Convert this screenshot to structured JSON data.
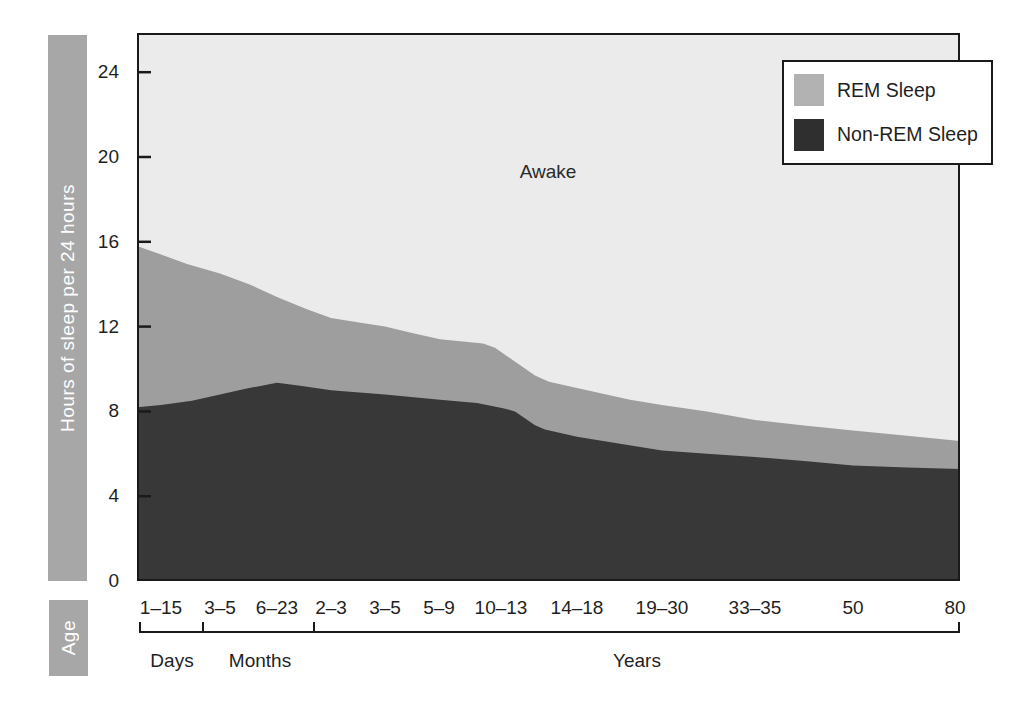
{
  "page": {
    "background": "#ffffff"
  },
  "y_axis_bar": {
    "label": "Hours of sleep per 24 hours"
  },
  "age_bar": {
    "label": "Age"
  },
  "annotations": {
    "awake": "Awake"
  },
  "legend": {
    "items": [
      {
        "label": "REM Sleep",
        "color": "#b2b2b2"
      },
      {
        "label": "Non-REM Sleep",
        "color": "#2f2f2f"
      }
    ]
  },
  "colors": {
    "awake_region": "#ebebeb",
    "rem_region": "#9e9e9e",
    "nonrem_region": "#383838",
    "axis_line": "#1a1a1a",
    "side_bars": "#a7a7a7",
    "text": "#1f1f1f"
  },
  "chart_data": {
    "type": "area",
    "title": "",
    "ylabel": "Hours of sleep per 24 hours",
    "xlabel": "Age",
    "ylim": [
      0,
      25.8
    ],
    "yticks": [
      0,
      4,
      8,
      12,
      16,
      20,
      24
    ],
    "grid": false,
    "legend_position": "top-right",
    "regions": [
      "Awake",
      "REM Sleep",
      "Non-REM Sleep"
    ],
    "categories": [
      "1–15",
      "3–5",
      "6–23",
      "2–3",
      "3–5",
      "5–9",
      "10–13",
      "14–18",
      "19–30",
      "33–35",
      "50",
      "80"
    ],
    "category_x_px": [
      24,
      83,
      140,
      194,
      248,
      302,
      364,
      440,
      525,
      618,
      716,
      818
    ],
    "series": [
      {
        "name": "Total sleep (hours)",
        "values": [
          15.4,
          14.5,
          13.4,
          12.4,
          12.0,
          11.4,
          10.3,
          9.1,
          8.3,
          7.6,
          7.1,
          6.6
        ]
      },
      {
        "name": "Non-REM Sleep (hours)",
        "values": [
          8.3,
          8.8,
          9.35,
          9.0,
          8.8,
          8.55,
          8.0,
          6.8,
          6.15,
          5.85,
          5.45,
          5.3
        ]
      },
      {
        "name": "REM Sleep (hours)",
        "values": [
          7.1,
          5.7,
          4.05,
          3.4,
          3.2,
          2.85,
          2.3,
          2.3,
          2.15,
          1.75,
          1.65,
          1.3
        ]
      }
    ],
    "total_boundary_px_hours": [
      [
        0,
        15.8
      ],
      [
        24,
        15.4
      ],
      [
        50,
        14.95
      ],
      [
        83,
        14.5
      ],
      [
        112,
        14.0
      ],
      [
        140,
        13.4
      ],
      [
        168,
        12.85
      ],
      [
        194,
        12.4
      ],
      [
        222,
        12.2
      ],
      [
        248,
        12.0
      ],
      [
        275,
        11.7
      ],
      [
        303,
        11.4
      ],
      [
        346,
        11.2
      ],
      [
        358,
        11.0
      ],
      [
        398,
        9.7
      ],
      [
        412,
        9.4
      ],
      [
        440,
        9.1
      ],
      [
        493,
        8.55
      ],
      [
        525,
        8.3
      ],
      [
        570,
        8.0
      ],
      [
        618,
        7.6
      ],
      [
        665,
        7.35
      ],
      [
        716,
        7.1
      ],
      [
        770,
        6.85
      ],
      [
        823,
        6.6
      ]
    ],
    "nonrem_boundary_px_hours": [
      [
        0,
        8.2
      ],
      [
        24,
        8.3
      ],
      [
        55,
        8.5
      ],
      [
        83,
        8.8
      ],
      [
        112,
        9.1
      ],
      [
        140,
        9.35
      ],
      [
        165,
        9.2
      ],
      [
        194,
        9.0
      ],
      [
        248,
        8.8
      ],
      [
        303,
        8.55
      ],
      [
        340,
        8.4
      ],
      [
        366,
        8.15
      ],
      [
        378,
        8.0
      ],
      [
        398,
        7.35
      ],
      [
        408,
        7.15
      ],
      [
        440,
        6.8
      ],
      [
        480,
        6.5
      ],
      [
        525,
        6.15
      ],
      [
        570,
        6.0
      ],
      [
        618,
        5.85
      ],
      [
        670,
        5.65
      ],
      [
        716,
        5.45
      ],
      [
        770,
        5.35
      ],
      [
        823,
        5.28
      ]
    ],
    "age_units": [
      {
        "label": "Days",
        "tick_x_start": 3,
        "tick_x_end": 66,
        "label_x": 35
      },
      {
        "label": "Months",
        "tick_x_start": 66,
        "tick_x_end": 177,
        "label_x": 123
      },
      {
        "label": "Years",
        "tick_x_start": 177,
        "tick_x_end": 822,
        "label_x": 500
      }
    ]
  }
}
